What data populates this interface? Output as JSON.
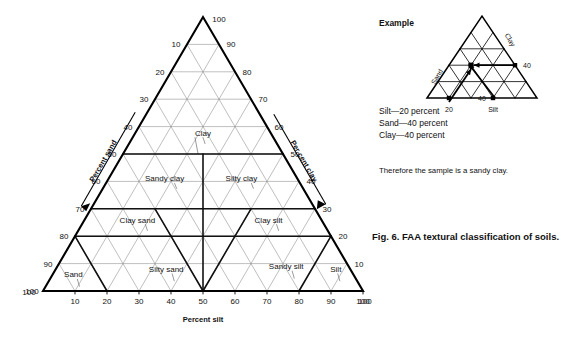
{
  "figure": {
    "caption": "Fig. 6. FAA textural classification of soils."
  },
  "main_chart": {
    "axes": {
      "bottom_label": "Percent silt",
      "left_label": "Percent sand",
      "right_label": "Per cent clay"
    },
    "ticks": {
      "bottom": [
        "10",
        "20",
        "30",
        "40",
        "50",
        "60",
        "70",
        "80",
        "90",
        "100"
      ],
      "bottom_corner_left": "100",
      "left": [
        "100",
        "90",
        "80",
        "70",
        "60",
        "50",
        "40",
        "30",
        "20",
        "10"
      ],
      "apex": "100",
      "right": [
        "90",
        "80",
        "70",
        "60",
        "50",
        "40",
        "30",
        "20",
        "10",
        "100"
      ]
    },
    "regions": [
      {
        "name": "Clay",
        "label": "Clay"
      },
      {
        "name": "Sandy clay",
        "label": "Sandy clay"
      },
      {
        "name": "Silty clay",
        "label": "Silty clay"
      },
      {
        "name": "Clay sand",
        "label": "Clay sand"
      },
      {
        "name": "Clay silt",
        "label": "Clay silt"
      },
      {
        "name": "Sand",
        "label": "Sand"
      },
      {
        "name": "Silty sand",
        "label": "Silty sand"
      },
      {
        "name": "Sandy silt",
        "label": "Sandy silt"
      },
      {
        "name": "Silt",
        "label": "Silt"
      }
    ]
  },
  "example": {
    "heading": "Example",
    "mini_chart": {
      "axis_clay": "Clay",
      "axis_sand": "Sand",
      "axis_silt": "Silt",
      "tick_sand": "40",
      "tick_clay": "40",
      "tick_silt": "20"
    },
    "values": [
      "Silt—20 percent",
      "Sand—40 percent",
      "Clay—40 percent"
    ],
    "conclusion": "Therefore the sample is a sandy clay."
  },
  "chart_data": {
    "type": "ternary",
    "title": "FAA textural classification of soils",
    "axes": {
      "a": {
        "name": "Percent sand",
        "range": [
          0,
          100
        ],
        "tick_step": 10,
        "position": "left"
      },
      "b": {
        "name": "Percent silt",
        "range": [
          0,
          100
        ],
        "tick_step": 10,
        "position": "bottom"
      },
      "c": {
        "name": "Per cent clay",
        "range": [
          0,
          100
        ],
        "tick_step": 10,
        "position": "right"
      }
    },
    "grid": true,
    "grid_step": 10,
    "legend": "none",
    "classes": [
      {
        "label": "Clay",
        "clay_range": [
          50,
          100
        ],
        "sand_range": [
          0,
          50
        ],
        "silt_range": [
          0,
          50
        ],
        "centroid": {
          "sand": 22,
          "silt": 22,
          "clay": 56
        }
      },
      {
        "label": "Sandy clay",
        "clay_range": [
          30,
          50
        ],
        "sand_range": [
          30,
          70
        ],
        "silt_range": [
          0,
          40
        ],
        "centroid": {
          "sand": 42,
          "silt": 18,
          "clay": 40
        }
      },
      {
        "label": "Silty clay",
        "clay_range": [
          30,
          50
        ],
        "sand_range": [
          0,
          40
        ],
        "silt_range": [
          30,
          70
        ],
        "centroid": {
          "sand": 18,
          "silt": 42,
          "clay": 40
        }
      },
      {
        "label": "Clay sand",
        "clay_range": [
          20,
          30
        ],
        "sand_range": [
          50,
          80
        ],
        "silt_range": [
          0,
          30
        ],
        "centroid": {
          "sand": 58,
          "silt": 17,
          "clay": 25
        }
      },
      {
        "label": "Clay silt",
        "clay_range": [
          20,
          30
        ],
        "sand_range": [
          0,
          30
        ],
        "silt_range": [
          50,
          80
        ],
        "centroid": {
          "sand": 17,
          "silt": 58,
          "clay": 25
        }
      },
      {
        "label": "Sand",
        "clay_range": [
          0,
          20
        ],
        "sand_range": [
          80,
          100
        ],
        "silt_range": [
          0,
          20
        ],
        "centroid": {
          "sand": 88,
          "silt": 7,
          "clay": 5
        }
      },
      {
        "label": "Silty sand",
        "clay_range": [
          0,
          20
        ],
        "sand_range": [
          50,
          80
        ],
        "silt_range": [
          20,
          50
        ],
        "centroid": {
          "sand": 58,
          "silt": 35,
          "clay": 7
        }
      },
      {
        "label": "Sandy silt",
        "clay_range": [
          0,
          20
        ],
        "sand_range": [
          20,
          50
        ],
        "silt_range": [
          50,
          80
        ],
        "centroid": {
          "sand": 20,
          "silt": 72,
          "clay": 8
        }
      },
      {
        "label": "Silt",
        "clay_range": [
          0,
          20
        ],
        "sand_range": [
          0,
          20
        ],
        "silt_range": [
          80,
          100
        ],
        "centroid": {
          "sand": 5,
          "silt": 88,
          "clay": 7
        }
      }
    ],
    "example_point": {
      "sand": 40,
      "silt": 20,
      "clay": 40,
      "classification": "sandy clay"
    }
  }
}
